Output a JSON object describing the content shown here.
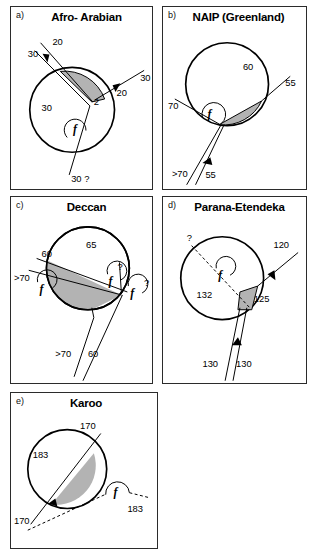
{
  "figure": {
    "shade_color": "#b3b3b3",
    "line_color": "#000000",
    "panel_border_color": "#2b2b2b"
  },
  "panels": [
    {
      "id": "a",
      "letter": "a)",
      "title": "Afro- Arabian",
      "f_markers": [
        {
          "label": "f",
          "x": 68,
          "y": 122
        }
      ],
      "labels": [
        {
          "text": "20",
          "x": 42,
          "y": 38
        },
        {
          "text": "30",
          "x": 17,
          "y": 50
        },
        {
          "text": "30",
          "x": 131,
          "y": 75
        },
        {
          "text": "20",
          "x": 107,
          "y": 90
        },
        {
          "text": "2",
          "x": 84,
          "y": 99
        },
        {
          "text": "30",
          "x": 31,
          "y": 105
        },
        {
          "text": "30 ?",
          "x": 61,
          "y": 177
        }
      ]
    },
    {
      "id": "b",
      "letter": "b)",
      "title": "NAIP (Greenland)",
      "f_markers": [
        {
          "label": "f",
          "x": 50,
          "y": 105
        }
      ],
      "labels": [
        {
          "text": "60",
          "x": 81,
          "y": 64
        },
        {
          "text": "55",
          "x": 124,
          "y": 80
        },
        {
          "text": "70",
          "x": 9,
          "y": 103
        },
        {
          "text": ">70",
          "x": 11,
          "y": 172
        },
        {
          "text": "55",
          "x": 48,
          "y": 173
        }
      ]
    },
    {
      "id": "c",
      "letter": "c)",
      "title": "Deccan",
      "f_markers": [
        {
          "label": "f",
          "x": 33,
          "y": 93
        },
        {
          "label": "f",
          "x": 102,
          "y": 85
        },
        {
          "label": "f",
          "x": 125,
          "y": 97
        }
      ],
      "labels": [
        {
          "text": "65",
          "x": 83,
          "y": 51
        },
        {
          "text": "60",
          "x": 35,
          "y": 61
        },
        {
          "text": "?",
          "x": 110,
          "y": 73
        },
        {
          "text": ">70",
          "x": 7,
          "y": 85
        },
        {
          "text": "?",
          "x": 138,
          "y": 90
        },
        {
          "text": ">70",
          "x": 50,
          "y": 162
        },
        {
          "text": "60",
          "x": 82,
          "y": 162
        }
      ]
    },
    {
      "id": "d",
      "letter": "d)",
      "title": "Parana-Etendeka",
      "f_markers": [
        {
          "label": "f",
          "x": 62,
          "y": 66
        }
      ],
      "labels": [
        {
          "text": "?",
          "x": 27,
          "y": 44
        },
        {
          "text": "120",
          "x": 119,
          "y": 51
        },
        {
          "text": "132",
          "x": 41,
          "y": 102
        },
        {
          "text": "125",
          "x": 90,
          "y": 106
        },
        {
          "text": "130",
          "x": 48,
          "y": 172
        },
        {
          "text": "130",
          "x": 79,
          "y": 172
        }
      ]
    },
    {
      "id": "e",
      "letter": "e)",
      "title": "Karoo",
      "f_markers": [
        {
          "label": "f",
          "x": 112,
          "y": 100
        }
      ],
      "labels": [
        {
          "text": "170",
          "x": 78,
          "y": 36
        },
        {
          "text": "183",
          "x": 27,
          "y": 66
        },
        {
          "text": "183",
          "x": 123,
          "y": 121
        },
        {
          "text": "170",
          "x": 8,
          "y": 133
        }
      ]
    }
  ]
}
